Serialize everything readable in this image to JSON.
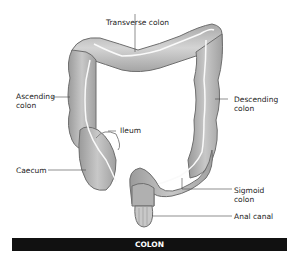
{
  "diagram": {
    "title": "COLON",
    "labels": {
      "transverse": "Transverse colon",
      "ascending": "Ascending\ncolon",
      "descending": "Descending\ncolon",
      "ileum": "Ileum",
      "caecum": "Caecum",
      "sigmoid": "Sigmoid\ncolon",
      "anal": "Anal canal"
    },
    "colors": {
      "fill": "#b4b4b4",
      "fill_light": "#d2d2d2",
      "outline": "#6e6e6e",
      "caption_bg": "#111111",
      "caption_text": "#ffffff"
    }
  }
}
